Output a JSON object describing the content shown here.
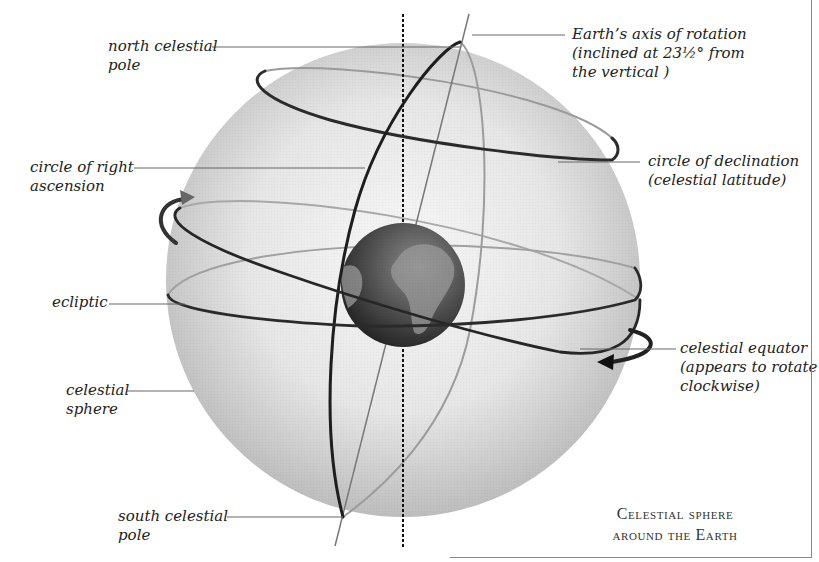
{
  "diagram": {
    "caption": {
      "line1": "Celestial sphere",
      "line2": "around the Earth"
    },
    "labels": {
      "earth_axis": {
        "line1": "Earth’s axis of rotation",
        "line2": "(inclined at 23½° from",
        "line3": "the vertical )"
      },
      "north_pole": {
        "line1": "north celestial",
        "line2": "pole"
      },
      "right_ascension": {
        "line1": "circle of right",
        "line2": "ascension"
      },
      "declination": {
        "line1": "circle of declination",
        "line2": "(celestial latitude)"
      },
      "ecliptic": {
        "line1": "ecliptic"
      },
      "celestial_equator": {
        "line1": "celestial equator",
        "line2": "(appears to rotate",
        "line3": "clockwise)"
      },
      "celestial_sphere": {
        "line1": "celestial",
        "line2": "sphere"
      },
      "south_pole": {
        "line1": "south celestial",
        "line2": "pole"
      }
    },
    "axis_tilt_degrees": "23½",
    "colors": {
      "sphere_light": "#f2f2f2",
      "sphere_dark": "#bdbdbd",
      "earth_dark": "#2e2e2e",
      "earth_light": "#8a8a8a",
      "ring": "#2a2a2a",
      "leader": "#555555"
    }
  }
}
